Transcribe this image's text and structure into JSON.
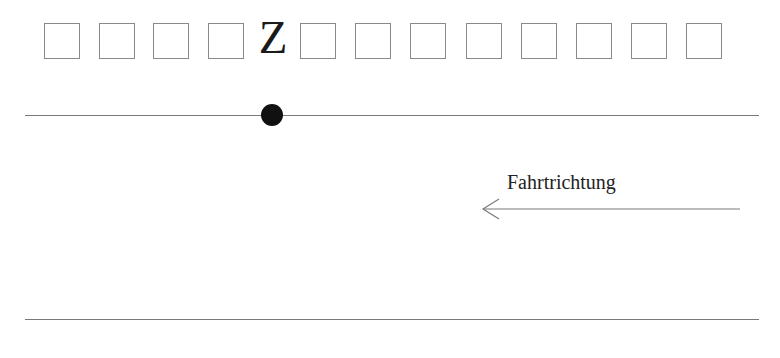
{
  "top_row": {
    "cells_before_z": 4,
    "cells_after_z": 8,
    "cell_positions_x": [
      44,
      99,
      153,
      208,
      300,
      355,
      410,
      466,
      521,
      576,
      631,
      686
    ],
    "marker_label": "Z"
  },
  "lane": {
    "top_line_y": 115,
    "bottom_line_y": 319,
    "marker_dot": {
      "x": 272,
      "y": 115,
      "color": "#111111"
    }
  },
  "direction": {
    "label": "Fahrtrichtung",
    "arrow": "left-arrow"
  },
  "colors": {
    "cell_border": "#8a8a8a",
    "line": "#7a7a7a",
    "text": "#222222",
    "background": "#ffffff"
  }
}
